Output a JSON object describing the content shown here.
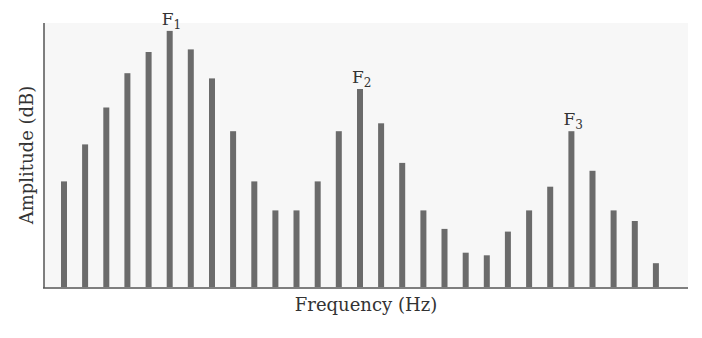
{
  "chart_data": {
    "type": "bar",
    "title": "",
    "xlabel": "Frequency (Hz)",
    "ylabel": "Amplitude (dB)",
    "ylim": [
      0,
      100
    ],
    "grid": false,
    "legend": null,
    "categories": [
      1,
      2,
      3,
      4,
      5,
      6,
      7,
      8,
      9,
      10,
      11,
      12,
      13,
      14,
      15,
      16,
      17,
      18,
      19,
      20,
      21,
      22,
      23,
      24,
      25,
      26,
      27,
      28,
      29
    ],
    "values": [
      40,
      54,
      68,
      81,
      89,
      97,
      90,
      79,
      59,
      40,
      29,
      29,
      40,
      59,
      75,
      62,
      47,
      29,
      22,
      13,
      12,
      21,
      29,
      38,
      59,
      44,
      29,
      25,
      9
    ],
    "annotations": [
      {
        "text": "F",
        "subscript": "1",
        "bar_index": 5
      },
      {
        "text": "F",
        "subscript": "2",
        "bar_index": 14
      },
      {
        "text": "F",
        "subscript": "3",
        "bar_index": 24
      }
    ],
    "colors": {
      "bar": "#6b6b6b",
      "axis": "#555555",
      "plot_bg": "#f7f7f7",
      "text": "#333333"
    }
  }
}
